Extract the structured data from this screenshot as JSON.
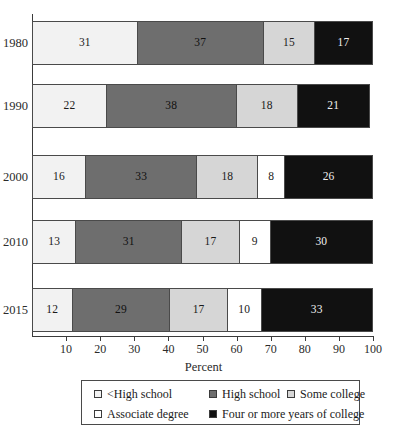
{
  "chart_data": {
    "type": "bar",
    "orientation": "horizontal",
    "stacked": true,
    "title": "",
    "xlabel": "Percent",
    "ylabel": "",
    "xlim": [
      0,
      100
    ],
    "grid": false,
    "legend_position": "bottom",
    "categories": [
      "1980",
      "1990",
      "2000",
      "2010",
      "2015"
    ],
    "series": [
      {
        "name": "<High school",
        "color": "#f2f2f2",
        "values": [
          31,
          22,
          16,
          13,
          12
        ]
      },
      {
        "name": "High school",
        "color": "#6e6e6e",
        "values": [
          37,
          38,
          33,
          31,
          29
        ]
      },
      {
        "name": "Some college",
        "color": "#d6d6d6",
        "values": [
          15,
          18,
          18,
          17,
          17
        ]
      },
      {
        "name": "Associate degree",
        "color": "#ffffff",
        "values": [
          null,
          null,
          8,
          9,
          10
        ]
      },
      {
        "name": "Four or more years of college",
        "color": "#111111",
        "values": [
          17,
          21,
          26,
          30,
          33
        ]
      }
    ],
    "xticks": [
      10,
      20,
      30,
      40,
      50,
      60,
      70,
      80,
      90,
      100
    ],
    "xtick_labels": [
      "10",
      "20",
      "30",
      "40",
      "50",
      "60",
      "70",
      "80",
      "90",
      "100"
    ]
  },
  "rows": [
    {
      "year": "1980",
      "segments": [
        {
          "series": "<High school",
          "value": 31,
          "label": "31",
          "fill": "c-lths"
        },
        {
          "series": "High school",
          "value": 37,
          "label": "37",
          "fill": "c-hs"
        },
        {
          "series": "Some college",
          "value": 15,
          "label": "15",
          "fill": "c-some"
        },
        {
          "series": "Four or more years of college",
          "value": 17,
          "label": "17",
          "fill": "c-four"
        }
      ]
    },
    {
      "year": "1990",
      "segments": [
        {
          "series": "<High school",
          "value": 22,
          "label": "22",
          "fill": "c-lths"
        },
        {
          "series": "High school",
          "value": 38,
          "label": "38",
          "fill": "c-hs"
        },
        {
          "series": "Some college",
          "value": 18,
          "label": "18",
          "fill": "c-some"
        },
        {
          "series": "Four or more years of college",
          "value": 21,
          "label": "21",
          "fill": "c-four"
        }
      ]
    },
    {
      "year": "2000",
      "segments": [
        {
          "series": "<High school",
          "value": 16,
          "label": "16",
          "fill": "c-lths"
        },
        {
          "series": "High school",
          "value": 33,
          "label": "33",
          "fill": "c-hs"
        },
        {
          "series": "Some college",
          "value": 18,
          "label": "18",
          "fill": "c-some"
        },
        {
          "series": "Associate degree",
          "value": 8,
          "label": "8",
          "fill": "c-assoc"
        },
        {
          "series": "Four or more years of college",
          "value": 26,
          "label": "26",
          "fill": "c-four"
        }
      ]
    },
    {
      "year": "2010",
      "segments": [
        {
          "series": "<High school",
          "value": 13,
          "label": "13",
          "fill": "c-lths"
        },
        {
          "series": "High school",
          "value": 31,
          "label": "31",
          "fill": "c-hs"
        },
        {
          "series": "Some college",
          "value": 17,
          "label": "17",
          "fill": "c-some"
        },
        {
          "series": "Associate degree",
          "value": 9,
          "label": "9",
          "fill": "c-assoc"
        },
        {
          "series": "Four or more years of college",
          "value": 30,
          "label": "30",
          "fill": "c-four"
        }
      ]
    },
    {
      "year": "2015",
      "segments": [
        {
          "series": "<High school",
          "value": 12,
          "label": "12",
          "fill": "c-lths"
        },
        {
          "series": "High school",
          "value": 29,
          "label": "29",
          "fill": "c-hs"
        },
        {
          "series": "Some college",
          "value": 17,
          "label": "17",
          "fill": "c-some"
        },
        {
          "series": "Associate degree",
          "value": 10,
          "label": "10",
          "fill": "c-assoc"
        },
        {
          "series": "Four or more years of college",
          "value": 33,
          "label": "33",
          "fill": "c-four"
        }
      ]
    }
  ],
  "axis": {
    "x_title": "Percent",
    "ticks": [
      "10",
      "20",
      "30",
      "40",
      "50",
      "60",
      "70",
      "80",
      "90",
      "100"
    ]
  },
  "legend": {
    "rows": [
      [
        {
          "label": "<High school",
          "fill": "c-lths",
          "name": "legend-swatch-less-than-high-school"
        },
        {
          "label": "High school",
          "fill": "c-hs",
          "name": "legend-swatch-high-school"
        },
        {
          "label": "Some college",
          "fill": "c-some",
          "name": "legend-swatch-some-college"
        }
      ],
      [
        {
          "label": "Associate degree",
          "fill": "c-assoc",
          "name": "legend-swatch-associate-degree"
        },
        {
          "label": "Four or more years of college",
          "fill": "c-four",
          "name": "legend-swatch-four-or-more-years"
        }
      ]
    ]
  }
}
